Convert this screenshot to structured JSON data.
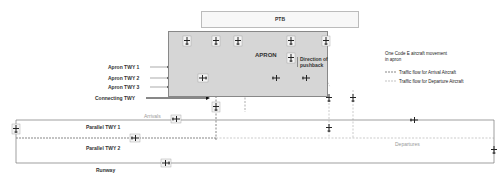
{
  "diagram": {
    "ptb_label": "PTB",
    "apron_label": "APRON",
    "pushback_label": "Direction of pushback",
    "apron_twys": [
      "Apron TWY 1",
      "Apron TWY 2",
      "Apron TWY 3"
    ],
    "connecting_twy": "Connecting TWY",
    "parallel_twys": [
      "Parallel TWY 1",
      "Parallel TWY 2"
    ],
    "runway": "Runway",
    "arrivals": "Arrivals",
    "departures": "Departures"
  },
  "legend": {
    "title_line1": "One Code E aircraft movement",
    "title_line2": "in apron",
    "arrival": "Traffic flow for Arrival  Aircraft",
    "departure": "Traffic flow for Departure Aircraft"
  },
  "colors": {
    "apron_bg": "#d6d6d6",
    "arrival_line": "#555555",
    "departure_line": "#aaaaaa"
  }
}
